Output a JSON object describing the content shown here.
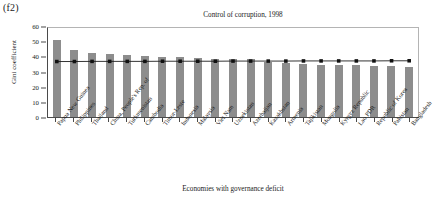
{
  "figure_label": "(f2)",
  "chart_data": {
    "type": "bar",
    "title": "Control of corruption, 1998",
    "xlabel": "Economies with governance deficit",
    "ylabel": "Gini coefficient",
    "ylim": [
      0,
      60
    ],
    "yticks": [
      0,
      10,
      20,
      30,
      40,
      50,
      60
    ],
    "grid": false,
    "legend": "none",
    "categories": [
      "Papua New Guinea",
      "Philippines",
      "Thailand",
      "China, People's Rep. of",
      "Turkmenistan",
      "Cambodia",
      "Timor-Leste",
      "Indonesia",
      "Malaysia",
      "Viet Nam",
      "Uzbekistan",
      "Azerbaijan",
      "Kazakhstan",
      "Armenia",
      "Tajikistan",
      "Mongolia",
      "Kyrgyz Republic",
      "Lao PDR",
      "Republic of Korea",
      "Pakistan",
      "Bangladesh"
    ],
    "series": [
      {
        "name": "Gini coefficient",
        "type": "bar",
        "values": [
          51,
          44,
          42,
          41.5,
          41,
          40.5,
          39.5,
          39.5,
          39,
          38.5,
          38.5,
          38,
          36,
          35.5,
          35,
          34.5,
          34,
          34,
          33.5,
          33.5,
          33
        ]
      },
      {
        "name": "Average",
        "type": "line",
        "values": [
          37.4,
          37.4,
          37.5,
          37.5,
          37.5,
          37.5,
          37.6,
          37.6,
          37.6,
          37.6,
          37.7,
          37.7,
          37.7,
          37.7,
          37.8,
          37.8,
          37.8,
          37.8,
          37.8,
          37.9,
          37.9
        ]
      }
    ]
  }
}
